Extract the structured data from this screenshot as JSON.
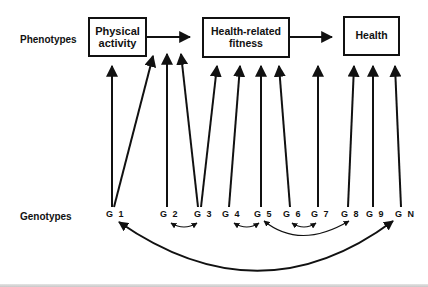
{
  "diagram": {
    "rows": {
      "phenotypes_label": "Phenotypes",
      "genotypes_label": "Genotypes"
    },
    "phenotypes": [
      {
        "id": "physical-activity",
        "label": "Physical\nactivity"
      },
      {
        "id": "health-related-fitness",
        "label": "Health-related\nfitness"
      },
      {
        "id": "health",
        "label": "Health"
      }
    ],
    "phenotype_edges": [
      {
        "from": "physical-activity",
        "to": "health-related-fitness"
      },
      {
        "from": "health-related-fitness",
        "to": "health"
      }
    ],
    "genotypes": [
      {
        "id": "G1",
        "label": "G 1"
      },
      {
        "id": "G2",
        "label": "G 2"
      },
      {
        "id": "G3",
        "label": "G 3"
      },
      {
        "id": "G4",
        "label": "G 4"
      },
      {
        "id": "G5",
        "label": "G 5"
      },
      {
        "id": "G6",
        "label": "G 6"
      },
      {
        "id": "G7",
        "label": "G 7"
      },
      {
        "id": "G8",
        "label": "G 8"
      },
      {
        "id": "G9",
        "label": "G 9"
      },
      {
        "id": "GN",
        "label": "G N"
      }
    ],
    "genotype_to_phenotype_edges": [
      {
        "from": "G1",
        "to": "physical-activity"
      },
      {
        "from": "G1",
        "to": "health-related-fitness"
      },
      {
        "from": "G2",
        "to": "health-related-fitness"
      },
      {
        "from": "G3",
        "to": "health-related-fitness"
      },
      {
        "from": "G3",
        "to": "health-related-fitness"
      },
      {
        "from": "G4",
        "to": "health-related-fitness"
      },
      {
        "from": "G5",
        "to": "health-related-fitness"
      },
      {
        "from": "G6",
        "to": "health-related-fitness"
      },
      {
        "from": "G7",
        "to": "health"
      },
      {
        "from": "G8",
        "to": "health"
      },
      {
        "from": "G9",
        "to": "health"
      },
      {
        "from": "GN",
        "to": "health"
      }
    ],
    "genotype_interactions": [
      {
        "a": "G2",
        "b": "G3",
        "type": "bidirectional"
      },
      {
        "a": "G4",
        "b": "G5",
        "type": "bidirectional"
      },
      {
        "a": "G6",
        "b": "G7",
        "type": "bidirectional"
      },
      {
        "a": "G5",
        "b": "G8",
        "type": "bidirectional"
      },
      {
        "a": "G1",
        "b": "GN",
        "type": "bidirectional"
      }
    ],
    "colors": {
      "stroke": "#111111",
      "background": "#ffffff"
    }
  }
}
